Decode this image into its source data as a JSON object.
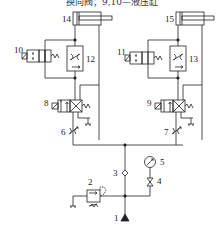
{
  "caption": "换向阀；9,10—液压缸",
  "labels": {
    "n1": "1",
    "n2": "2",
    "n3": "3",
    "n4": "4",
    "n5": "5",
    "n6": "6",
    "n7": "7",
    "n8": "8",
    "n9": "9",
    "n10": "10",
    "n11": "11",
    "n12": "12",
    "n13": "13",
    "n14": "14",
    "n15": "15"
  },
  "components": [
    {
      "id": "1",
      "type": "pump-source"
    },
    {
      "id": "2",
      "type": "relief-valve"
    },
    {
      "id": "3",
      "type": "check-valve"
    },
    {
      "id": "4",
      "type": "shutoff-valve"
    },
    {
      "id": "5",
      "type": "pressure-gauge"
    },
    {
      "id": "6",
      "type": "throttle-valve"
    },
    {
      "id": "7",
      "type": "throttle-valve"
    },
    {
      "id": "8",
      "type": "directional-valve"
    },
    {
      "id": "9",
      "type": "directional-valve"
    },
    {
      "id": "10",
      "type": "solenoid-valve"
    },
    {
      "id": "11",
      "type": "solenoid-valve"
    },
    {
      "id": "12",
      "type": "flow-control-valve"
    },
    {
      "id": "13",
      "type": "flow-control-valve"
    },
    {
      "id": "14",
      "type": "hydraulic-cylinder"
    },
    {
      "id": "15",
      "type": "hydraulic-cylinder"
    }
  ]
}
